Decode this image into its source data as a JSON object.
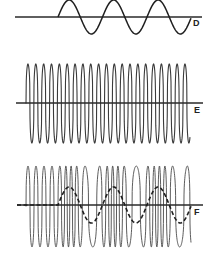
{
  "diagram": {
    "title": "",
    "panels": [
      {
        "id": "D",
        "label": "D",
        "description": "modulating signal (low-frequency sine wave)",
        "axis": {
          "x1": 15,
          "x2": 202,
          "y": 17
        },
        "wave": {
          "start_x": 58,
          "end_x": 191,
          "period": 44.5,
          "amplitude": 17
        },
        "label_pos": {
          "x": 193,
          "y": 26
        }
      },
      {
        "id": "E",
        "label": "E",
        "description": "carrier wave (high-frequency, constant amplitude)",
        "axis": {
          "x1": 16,
          "x2": 203,
          "y": 103
        },
        "wave": {
          "start_x": 26,
          "end_x": 190,
          "period": 7.85,
          "top": 64,
          "bottom": 143
        },
        "label_pos": {
          "x": 194,
          "y": 113
        }
      },
      {
        "id": "F",
        "label": "F",
        "description": "frequency-modulated wave with modulating signal overlaid (dashed)",
        "axis": {
          "x1": 17,
          "x2": 203,
          "y": 205
        },
        "wave": {
          "start_x": 26,
          "end_x": 191,
          "base_period": 8,
          "top": 166,
          "bottom": 247,
          "deviation": 0.55
        },
        "modulator": {
          "start_x": 58,
          "end_x": 191,
          "period": 44.5,
          "amplitude": 18,
          "style": "dashed"
        },
        "label_pos": {
          "x": 194,
          "y": 215
        }
      }
    ]
  }
}
